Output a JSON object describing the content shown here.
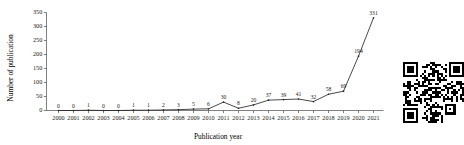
{
  "chart_data": {
    "type": "line",
    "title": "",
    "subtitle": "",
    "xlabel": "Publication year",
    "ylabel": "Number of publication",
    "categories": [
      "2000",
      "2001",
      "2002",
      "2003",
      "2004",
      "2005",
      "2006",
      "2007",
      "2008",
      "2009",
      "2010",
      "2011",
      "2012",
      "2013",
      "2014",
      "2015",
      "2016",
      "2017",
      "2018",
      "2019",
      "2020",
      "2021"
    ],
    "values": [
      0,
      0,
      1,
      0,
      0,
      1,
      1,
      2,
      3,
      5,
      6,
      30,
      8,
      20,
      37,
      39,
      41,
      32,
      58,
      69,
      194,
      331
    ],
    "point_labels": [
      "0",
      "0",
      "1",
      "0",
      "0",
      "1",
      "1",
      "2",
      "3",
      "5",
      "6",
      "30",
      "8",
      "20",
      "37",
      "39",
      "41",
      "32",
      "58",
      "69",
      "194",
      "331"
    ],
    "ylim": [
      0,
      350
    ],
    "yticks": [
      0,
      50,
      100,
      150,
      200,
      250,
      300,
      350
    ],
    "ytick_labels": [
      "0",
      "50",
      "100",
      "150",
      "200",
      "250",
      "300",
      "350"
    ],
    "grid": false,
    "legend": "none",
    "series_color": "#1a1a1a",
    "marker": "dot",
    "show_data_labels": true
  },
  "figure": {
    "background_color": "#ffffff",
    "axis_color": "#4a4a4a",
    "text_color": "#000000"
  },
  "qr_code": {
    "name": "qr-code-image",
    "alt_text": "QR code",
    "foreground_color": "#000000",
    "background_color": "#ffffff"
  }
}
